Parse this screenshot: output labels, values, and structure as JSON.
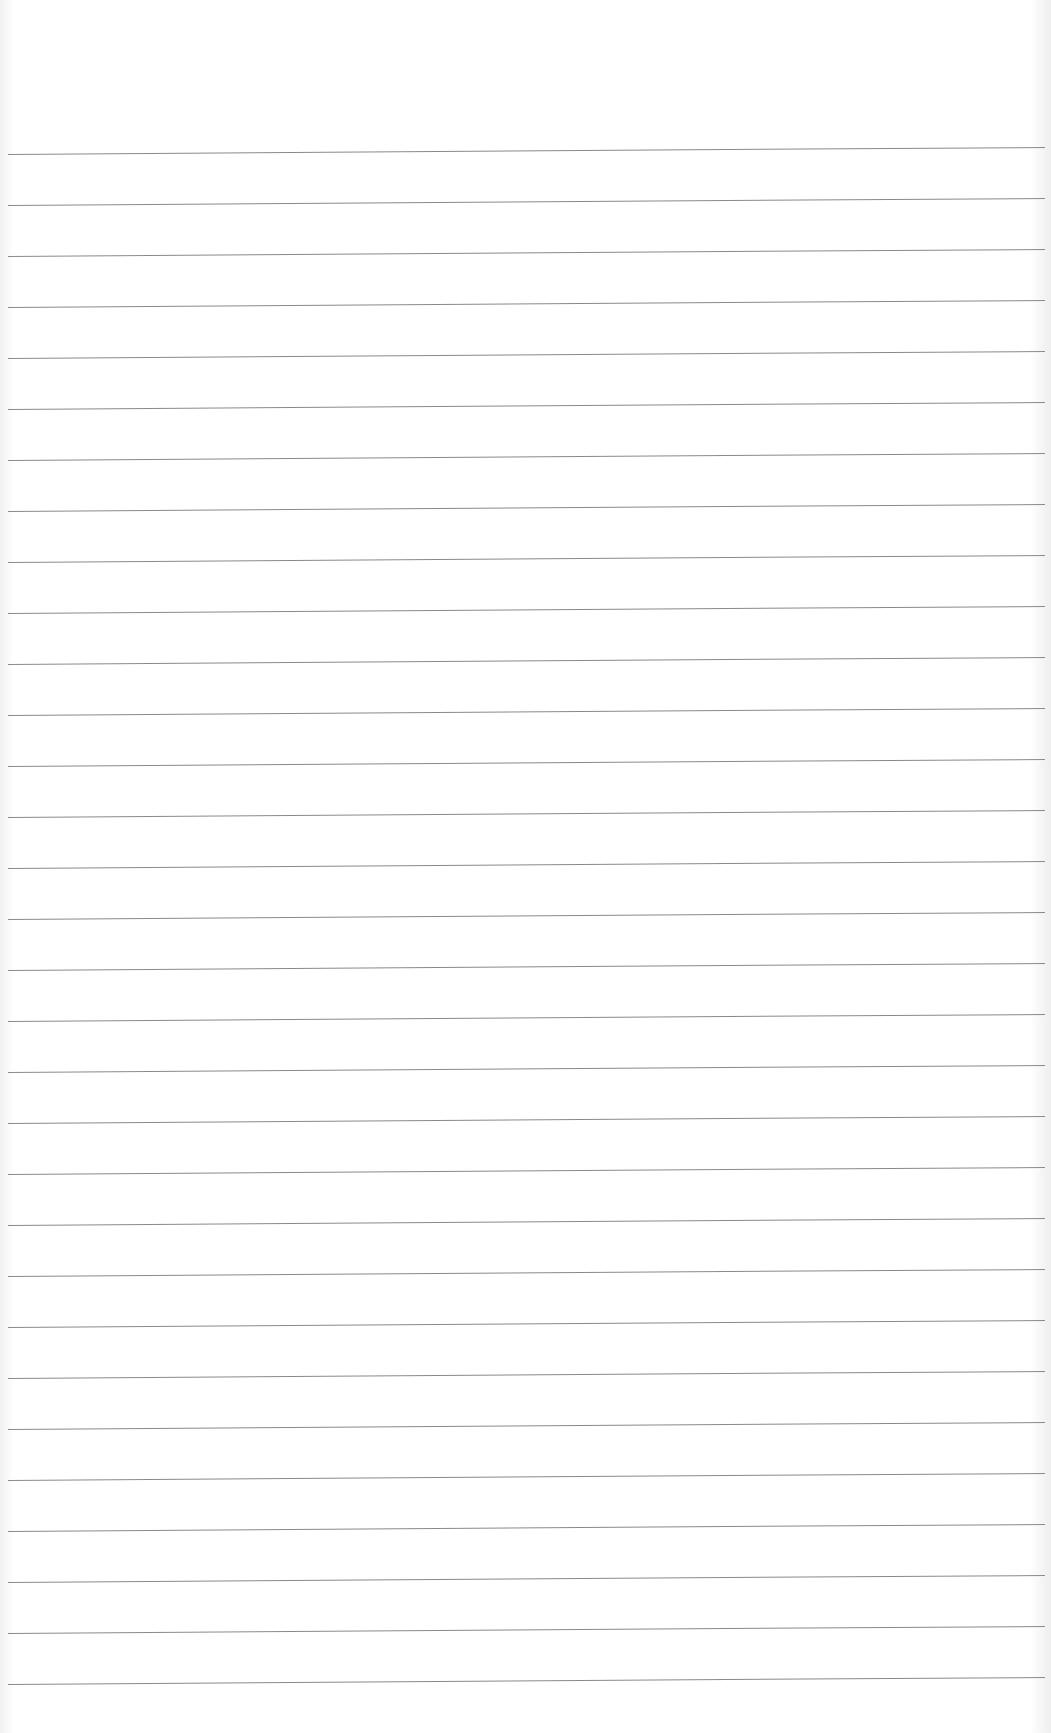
{
  "document": {
    "type": "lined-paper",
    "header_bleed_through_text": "",
    "rules": {
      "count": 31,
      "first_y": 154,
      "spacing": 51,
      "color": "#8a8a8a"
    },
    "background_color": "#ffffff"
  }
}
